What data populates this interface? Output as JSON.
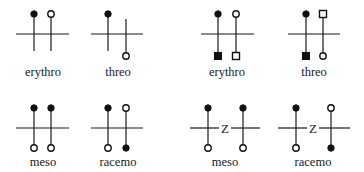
{
  "colors": {
    "ink": "#111111",
    "background": "#ffffff"
  },
  "figures": [
    {
      "id": "fig-erythro-circles",
      "label": "erythro",
      "type": "fischer-pair",
      "h_line": {
        "y": 34,
        "segments": [
          [
            16,
            69
          ]
        ]
      },
      "verticals": [
        {
          "x": 34,
          "y1": 14,
          "y2": 51,
          "top": "filled-circle",
          "bottom": null
        },
        {
          "x": 51,
          "y1": 14,
          "y2": 51,
          "top": "open-circle",
          "bottom": null
        }
      ],
      "label_pos": {
        "x": 43,
        "y": 76
      }
    },
    {
      "id": "fig-threo-circles",
      "label": "threo",
      "type": "fischer-pair",
      "h_line": {
        "y": 34,
        "segments": [
          [
            91,
            143
          ]
        ]
      },
      "verticals": [
        {
          "x": 108,
          "y1": 14,
          "y2": 51,
          "top": "filled-circle",
          "bottom": null
        },
        {
          "x": 126,
          "y1": 19,
          "y2": 56,
          "top": null,
          "bottom": "open-circle"
        }
      ],
      "label_pos": {
        "x": 118,
        "y": 76
      }
    },
    {
      "id": "fig-erythro-squares",
      "label": "erythro",
      "type": "fischer-pair",
      "h_line": {
        "y": 34,
        "segments": [
          [
            201,
            254
          ]
        ]
      },
      "verticals": [
        {
          "x": 218,
          "y1": 14,
          "y2": 56,
          "top": "filled-circle",
          "bottom": "filled-square"
        },
        {
          "x": 236,
          "y1": 14,
          "y2": 56,
          "top": "open-circle",
          "bottom": "open-square"
        }
      ],
      "label_pos": {
        "x": 227,
        "y": 76
      }
    },
    {
      "id": "fig-threo-squares",
      "label": "threo",
      "type": "fischer-pair",
      "h_line": {
        "y": 34,
        "segments": [
          [
            288,
            340
          ]
        ]
      },
      "verticals": [
        {
          "x": 306,
          "y1": 14,
          "y2": 56,
          "top": "filled-circle",
          "bottom": "filled-square"
        },
        {
          "x": 323,
          "y1": 14,
          "y2": 56,
          "top": "open-square",
          "bottom": "open-circle"
        }
      ],
      "label_pos": {
        "x": 314,
        "y": 76
      }
    },
    {
      "id": "fig-meso",
      "label": "meso",
      "type": "fischer-pair",
      "h_line": {
        "y": 128,
        "segments": [
          [
            16,
            69
          ]
        ]
      },
      "verticals": [
        {
          "x": 34,
          "y1": 108,
          "y2": 148,
          "top": "filled-circle",
          "bottom": "open-circle"
        },
        {
          "x": 51,
          "y1": 108,
          "y2": 148,
          "top": "filled-circle",
          "bottom": "open-circle"
        }
      ],
      "label_pos": {
        "x": 43,
        "y": 166
      }
    },
    {
      "id": "fig-racemo",
      "label": "racemo",
      "type": "fischer-pair",
      "h_line": {
        "y": 128,
        "segments": [
          [
            91,
            143
          ]
        ]
      },
      "verticals": [
        {
          "x": 108,
          "y1": 108,
          "y2": 148,
          "top": "filled-circle",
          "bottom": "open-circle"
        },
        {
          "x": 126,
          "y1": 108,
          "y2": 148,
          "top": "open-circle",
          "bottom": "filled-circle"
        }
      ],
      "label_pos": {
        "x": 118,
        "y": 166
      }
    },
    {
      "id": "fig-meso-z",
      "label": "meso",
      "type": "fischer-pair-z",
      "center_text": "Z",
      "center_pos": {
        "x": 225,
        "y": 132
      },
      "h_line": {
        "y": 128,
        "segments": [
          [
            190,
            219
          ],
          [
            231,
            260
          ]
        ]
      },
      "verticals": [
        {
          "x": 208,
          "y1": 108,
          "y2": 148,
          "top": "filled-circle",
          "bottom": "open-circle"
        },
        {
          "x": 243,
          "y1": 108,
          "y2": 148,
          "top": "filled-circle",
          "bottom": "open-circle"
        }
      ],
      "label_pos": {
        "x": 225,
        "y": 166
      }
    },
    {
      "id": "fig-racemo-z",
      "label": "racemo",
      "type": "fischer-pair-z",
      "center_text": "Z",
      "center_pos": {
        "x": 313,
        "y": 132
      },
      "h_line": {
        "y": 128,
        "segments": [
          [
            278,
            307
          ],
          [
            319,
            350
          ]
        ]
      },
      "verticals": [
        {
          "x": 296,
          "y1": 108,
          "y2": 148,
          "top": "filled-circle",
          "bottom": "open-circle"
        },
        {
          "x": 331,
          "y1": 108,
          "y2": 148,
          "top": "open-circle",
          "bottom": "filled-circle"
        }
      ],
      "label_pos": {
        "x": 313,
        "y": 166
      }
    }
  ]
}
